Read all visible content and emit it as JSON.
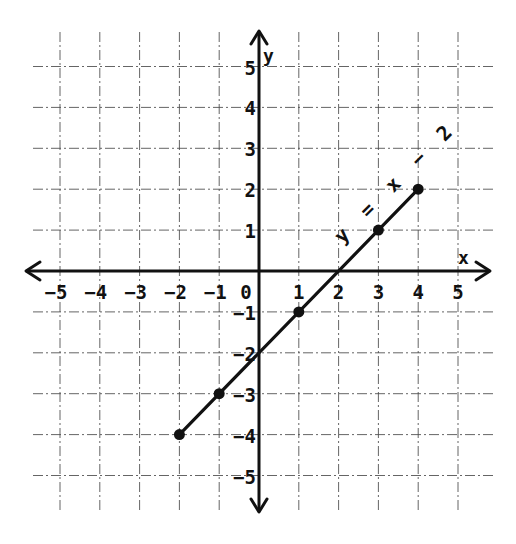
{
  "chart_data": {
    "type": "line",
    "title": "",
    "xlabel": "x",
    "ylabel": "y",
    "xlim": [
      -5,
      5
    ],
    "ylim": [
      -5,
      5
    ],
    "grid": true,
    "x_ticks": [
      -5,
      -4,
      -3,
      -2,
      -1,
      0,
      1,
      2,
      3,
      4,
      5
    ],
    "y_ticks": [
      -5,
      -4,
      -3,
      -2,
      -1,
      1,
      2,
      3,
      4,
      5
    ],
    "x_tick_labels": [
      "−5",
      "−4",
      "−3",
      "−2",
      "−1",
      "0",
      "1",
      "2",
      "3",
      "4",
      "5"
    ],
    "y_tick_labels": [
      "−5",
      "−4",
      "−3",
      "−2",
      "−1",
      "1",
      "2",
      "3",
      "4",
      "5"
    ],
    "series": [
      {
        "name": "y = x − 2",
        "x": [
          -2,
          -1,
          1,
          3,
          4
        ],
        "y": [
          -4,
          -3,
          -1,
          1,
          2
        ],
        "segment": {
          "from": [
            -2,
            -4
          ],
          "to": [
            4,
            2
          ]
        },
        "color": "#111111"
      }
    ],
    "annotations": [
      {
        "text": "y = x − 2",
        "rotation_deg": -45,
        "anchor": [
          2.1,
          0.65
        ]
      }
    ]
  },
  "labels": {
    "x_axis": "x",
    "y_axis": "y",
    "equation": "y = x − 2"
  }
}
